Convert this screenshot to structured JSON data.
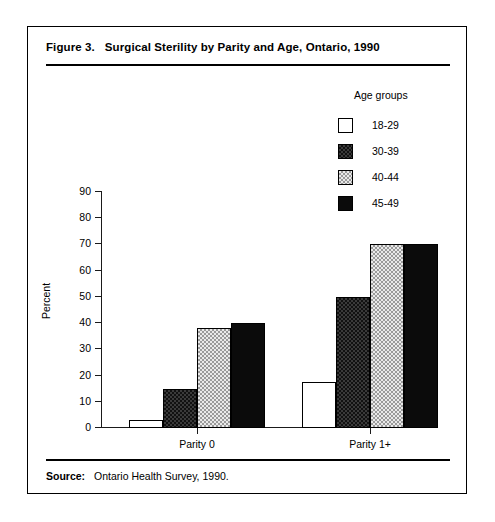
{
  "figure": {
    "title_number": "Figure 3.",
    "title_text": "Surgical Sterility by Parity and Age, Ontario, 1990",
    "source_label": "Source:",
    "source_text": "Ontario Health Survey, 1990."
  },
  "legend": {
    "title": "Age groups",
    "items": [
      {
        "label": "18-29",
        "swatch": "white-outline-swatch"
      },
      {
        "label": "30-39",
        "swatch": "dark-hatch-swatch"
      },
      {
        "label": "40-44",
        "swatch": "light-hatch-swatch"
      },
      {
        "label": "45-49",
        "swatch": "solid-black-swatch"
      }
    ]
  },
  "chart_data": {
    "type": "bar",
    "title": "Surgical Sterility by Parity and Age, Ontario, 1990",
    "xlabel": "",
    "ylabel": "Percent",
    "ylim": [
      0,
      90
    ],
    "yticks": [
      0,
      10,
      20,
      30,
      40,
      50,
      60,
      70,
      80,
      90
    ],
    "ytick_labels": [
      "0",
      "10",
      "20",
      "30",
      "40",
      "50",
      "60",
      "70",
      "80",
      "90"
    ],
    "grid": false,
    "legend_position": "top-right",
    "categories": [
      "Parity 0",
      "Parity 1+"
    ],
    "series": [
      {
        "name": "18-29",
        "values": [
          3,
          17.5
        ]
      },
      {
        "name": "30-39",
        "values": [
          15,
          50
        ]
      },
      {
        "name": "40-44",
        "values": [
          38,
          70
        ]
      },
      {
        "name": "45-49",
        "values": [
          40,
          70
        ]
      }
    ]
  }
}
